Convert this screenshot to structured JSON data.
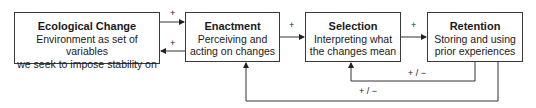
{
  "boxes": [
    {
      "id": "ecological-change",
      "title": "Ecological Change",
      "desc1": "Environment as set of variables",
      "desc2": "we seek to impose stability on"
    },
    {
      "id": "enactment",
      "title": "Enactment",
      "desc1": "Perceiving and",
      "desc2": "acting on changes"
    },
    {
      "id": "selection",
      "title": "Selection",
      "desc1": "Interpreting what",
      "desc2": "the changes mean"
    },
    {
      "id": "retention",
      "title": "Retention",
      "desc1": "Storing and using",
      "desc2": "prior experiences"
    }
  ],
  "labels": {
    "eco_to_enact": "+",
    "enact_to_eco": "+",
    "enact_to_sel": "+",
    "sel_to_ret": "+",
    "ret_to_sel": "+ / −",
    "ret_to_enact": "+ / −"
  }
}
